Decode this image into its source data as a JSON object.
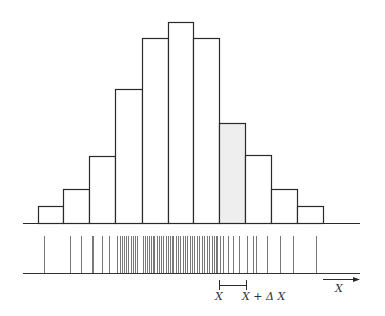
{
  "figure": {
    "colors": {
      "stroke": "#2a2a2a",
      "spike": "#555555",
      "highlight_fill": "#eeeeee",
      "background": "#ffffff"
    }
  },
  "histogram": {
    "baseline_y": 223,
    "axis": {
      "x1": 23,
      "x2": 360
    },
    "bin_edges_px": [
      38,
      63,
      89,
      115,
      142,
      168,
      193,
      219,
      245,
      271,
      297,
      323
    ],
    "bar_tops_px": [
      206,
      189,
      156,
      89,
      38,
      22,
      38,
      123,
      155,
      189,
      206
    ],
    "relative_heights": [
      1,
      2,
      4,
      8,
      11,
      12,
      11,
      6,
      4,
      2,
      1
    ],
    "highlighted_bin_index": 7
  },
  "strip": {
    "baseline_y": 273,
    "top_y": 236,
    "axis": {
      "x1": 23,
      "x2": 360
    },
    "sample_x_px": [
      44,
      70,
      81,
      92,
      93,
      102,
      109,
      117,
      120,
      122,
      124,
      126,
      128,
      131,
      133,
      135,
      137,
      143,
      145,
      147,
      149,
      151,
      153,
      154,
      157,
      159,
      161,
      163,
      166,
      168,
      170,
      172,
      173,
      176,
      178,
      180,
      183,
      185,
      187,
      190,
      192,
      194,
      197,
      199,
      202,
      204,
      207,
      209,
      212,
      214,
      216,
      217,
      220,
      223,
      228,
      233,
      239,
      247,
      253,
      256,
      267,
      280,
      293,
      316
    ]
  },
  "interval": {
    "x_start": 219,
    "x_end": 246,
    "y": 285,
    "label_start": "X",
    "label_end": "X + Δ X"
  },
  "axis_arrow": {
    "x1": 323,
    "x2": 360,
    "y": 279,
    "label": "X"
  }
}
